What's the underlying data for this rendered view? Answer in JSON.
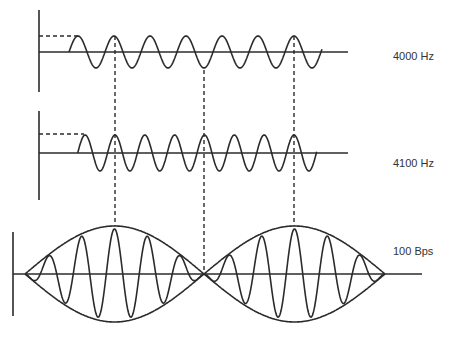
{
  "colors": {
    "stroke": "#2b2b2b",
    "background": "#ffffff",
    "text": "#333333"
  },
  "signals": [
    {
      "id": "tone1",
      "label": "4000 Hz",
      "frequency_hz": 4000
    },
    {
      "id": "tone2",
      "label": "4100 Hz",
      "frequency_hz": 4100
    },
    {
      "id": "beat",
      "label": "100 Bps",
      "beat_rate_bps": 100
    }
  ],
  "annotations": {
    "alignment_lines": "dashed vertical lines marking where the two tones align in phase (constructive) and out of phase (destructive)",
    "phase_offset_markers": "dashed horizontal lines showing initial amplitude offset"
  }
}
